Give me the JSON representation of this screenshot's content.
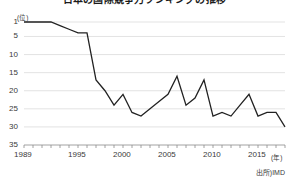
{
  "chart_data": {
    "type": "line",
    "title": "日本の国際競争力ランキングの推移",
    "subtitle": "",
    "xlabel": "年",
    "ylabel": "位",
    "ylim": [
      1,
      35
    ],
    "y_inverted": true,
    "xlim": [
      1989,
      2018
    ],
    "grid": true,
    "legend": false,
    "legend_position": "none",
    "source": "出所)IMD",
    "y_unit_label": "(位)",
    "x_unit_label": "(年)",
    "yticks": [
      1,
      5,
      10,
      15,
      20,
      25,
      30,
      35
    ],
    "ytick_labels": [
      "1",
      "5",
      "10",
      "15",
      "20",
      "25",
      "30",
      "35"
    ],
    "xticks": [
      1989,
      1995,
      2000,
      2005,
      2010,
      2015
    ],
    "xtick_labels": [
      "1989",
      "1995",
      "2000",
      "2005",
      "2010",
      "2015"
    ],
    "x": [
      1989,
      1990,
      1991,
      1992,
      1993,
      1994,
      1995,
      1996,
      1997,
      1998,
      1999,
      2000,
      2001,
      2002,
      2003,
      2004,
      2005,
      2006,
      2007,
      2008,
      2009,
      2010,
      2011,
      2012,
      2013,
      2014,
      2015,
      2016,
      2017,
      2018
    ],
    "values": [
      1,
      1,
      1,
      1,
      2,
      3,
      4,
      4,
      17,
      20,
      24,
      21,
      26,
      27,
      25,
      23,
      21,
      16,
      24,
      22,
      17,
      27,
      26,
      27,
      24,
      21,
      27,
      26,
      26,
      30
    ],
    "series": [
      {
        "name": "日本の競争力順位",
        "color": "#222222",
        "values": [
          1,
          1,
          1,
          1,
          2,
          3,
          4,
          4,
          17,
          20,
          24,
          21,
          26,
          27,
          25,
          23,
          21,
          16,
          24,
          22,
          17,
          27,
          26,
          27,
          24,
          21,
          27,
          26,
          26,
          30
        ]
      }
    ],
    "annotations": []
  },
  "colors": {
    "line": "#222222",
    "grid": "#dcdcdc",
    "axis": "#8a8a8a",
    "text": "#3a3a3a",
    "background": "#ffffff"
  }
}
